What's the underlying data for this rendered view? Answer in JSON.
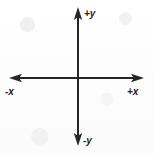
{
  "diagram": {
    "type": "coordinate-axes",
    "origin": {
      "x": 78,
      "y": 78
    },
    "stroke_color": "#262626",
    "background_color": "#fefefe",
    "stroke_width": 2,
    "axes": [
      {
        "name": "vertical-axis",
        "orientation": "vertical",
        "from": {
          "x": 78,
          "y": 145
        },
        "to": {
          "x": 78,
          "y": 8
        },
        "arrowheads": [
          "start",
          "end"
        ]
      },
      {
        "name": "horizontal-axis",
        "orientation": "horizontal",
        "from": {
          "x": 10,
          "y": 78
        },
        "to": {
          "x": 143,
          "y": 78
        },
        "arrowheads": [
          "start",
          "end"
        ]
      }
    ],
    "labels": {
      "positive_y": "+y",
      "negative_y": "-y",
      "negative_x": "-x",
      "positive_x": "+x"
    }
  }
}
